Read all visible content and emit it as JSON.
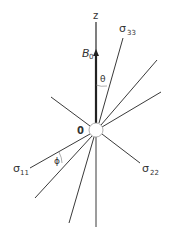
{
  "diagram": {
    "labels": {
      "z_axis": "z",
      "field": "B",
      "field_sub": "0",
      "origin": "0",
      "theta": "θ",
      "phi": "ϕ",
      "sigma33": "σ",
      "sigma33_sub": "33",
      "sigma11": "σ",
      "sigma11_sub": "11",
      "sigma22": "σ",
      "sigma22_sub": "22"
    },
    "colors": {
      "line": "#3a3a3a",
      "text": "#333333",
      "background": "#ffffff"
    }
  }
}
